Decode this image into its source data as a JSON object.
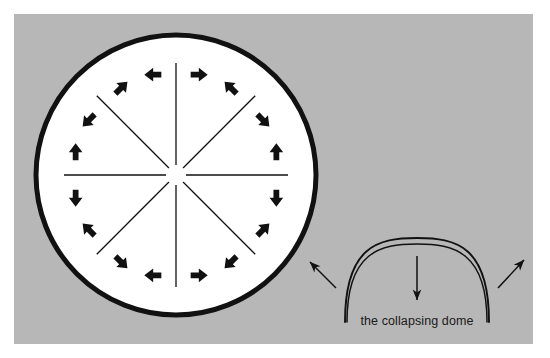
{
  "figure": {
    "caption": "the collapsing dome",
    "background_color": "#b7b7b7",
    "page_color": "#ffffff",
    "ink_color": "#111111"
  },
  "panel": {
    "x": 14,
    "y": 14,
    "width": 519,
    "height": 330
  },
  "circle_diagram": {
    "label": "circular dome plan view",
    "center_x": 176,
    "center_y": 175,
    "radius": 140,
    "stroke_width": 5,
    "fill": "#ffffff",
    "stroke": "#111111",
    "spoke_count": 8,
    "spoke_inner_radius": 10,
    "spoke_outer_radius": 112,
    "spoke_angles_deg": [
      0,
      45,
      90,
      135,
      180,
      225,
      270,
      315
    ],
    "arrow_count": 16,
    "arrow_radius": 103,
    "arrow_offset_deg": 13,
    "arrow_length": 17,
    "arrow_description": "pairs of bold arrows flanking each spoke, pointing perpendicular and away from the spoke"
  },
  "dome_diagram": {
    "label": "collapsing dome section view",
    "arc_outer": "M 345 322 C 345 246 378 238 417 238 C 456 238 489 246 489 322",
    "arc_inner": "M 347 322 C 347 252 380 244 417 244 C 454 244 487 252 487 322",
    "center_arrow": {
      "x": 417,
      "y_start": 256,
      "y_end": 300,
      "direction": "down"
    },
    "left_arrow": {
      "x_start": 336,
      "y_start": 288,
      "x_end": 310,
      "y_end": 262,
      "direction": "up-left"
    },
    "right_arrow": {
      "x_start": 498,
      "y_start": 288,
      "x_end": 524,
      "y_end": 260,
      "direction": "up-right"
    },
    "caption_x": 417,
    "caption_y": 325
  }
}
